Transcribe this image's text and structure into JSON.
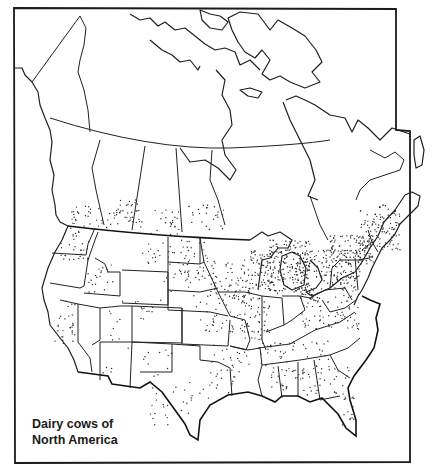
{
  "map": {
    "title_line1": "Dairy cows of",
    "title_line2": "North America",
    "style": "black-and-white dot-density map",
    "colors": {
      "line": "#1f1f1f",
      "dot": "#2a2a2a",
      "background": "#ffffff"
    },
    "regions_shown": [
      "Canada (provinces and territories)",
      "United States (contiguous states)",
      "Alaska panhandle edge"
    ],
    "density_notes": {
      "highest": [
        "Wisconsin",
        "Minnesota (SE)",
        "Michigan (S)",
        "New York",
        "Pennsylvania",
        "Southern Ontario",
        "Quebec (St. Lawrence valley)",
        "Vermont"
      ],
      "moderate": [
        "Iowa",
        "Ohio",
        "Indiana",
        "Illinois",
        "Missouri",
        "Kentucky",
        "Tennessee",
        "Virginia",
        "Washington (W)",
        "California (Central Valley)",
        "Idaho",
        "Alberta",
        "Saskatchewan (S)",
        "Manitoba (S)"
      ],
      "sparse": [
        "Nevada",
        "Wyoming",
        "Montana",
        "Arizona",
        "New Mexico",
        "Texas (W)",
        "Northern Canada"
      ]
    }
  }
}
